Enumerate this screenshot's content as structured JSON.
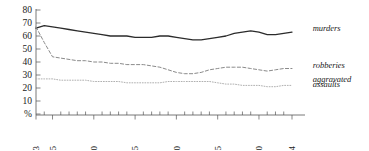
{
  "chart_data": {
    "type": "line",
    "title": "",
    "subtitle": "",
    "xlabel": "",
    "ylabel": "%",
    "xlim": [
      1973,
      2004
    ],
    "ylim": [
      0,
      80
    ],
    "grid": false,
    "legend_position": "right-inline",
    "y_ticks": [
      "80",
      "70",
      "60",
      "50",
      "40",
      "30",
      "20",
      "10",
      "%"
    ],
    "y_tick_values": [
      80,
      70,
      60,
      50,
      40,
      30,
      20,
      10,
      0
    ],
    "x_ticks": [
      "1973",
      "1975",
      "1980",
      "1985",
      "1990",
      "1995",
      "2000",
      "2004"
    ],
    "x_tick_values": [
      1973,
      1975,
      1980,
      1985,
      1990,
      1995,
      2000,
      2004
    ],
    "x": [
      1973,
      1974,
      1975,
      1976,
      1977,
      1978,
      1979,
      1980,
      1981,
      1982,
      1983,
      1984,
      1985,
      1986,
      1987,
      1988,
      1989,
      1990,
      1991,
      1992,
      1993,
      1994,
      1995,
      1996,
      1997,
      1998,
      1999,
      2000,
      2001,
      2002,
      2003,
      2004
    ],
    "series": [
      {
        "name": "murders",
        "label": "murders",
        "color": "#2b2b2b",
        "style": "solid",
        "width": 1.3,
        "values": [
          66,
          68,
          67,
          66,
          65,
          64,
          63,
          62,
          61,
          60,
          60,
          60,
          59,
          59,
          59,
          60,
          60,
          59,
          58,
          57,
          57,
          58,
          59,
          60,
          62,
          63,
          64,
          63,
          61,
          61,
          62,
          63
        ]
      },
      {
        "name": "robberies",
        "label": "robberies",
        "color": "#8a8a8a",
        "style": "dashed",
        "width": 1.0,
        "values": [
          67,
          55,
          44,
          43,
          42,
          41,
          41,
          40,
          40,
          39,
          39,
          38,
          38,
          38,
          37,
          36,
          34,
          32,
          31,
          31,
          32,
          34,
          35,
          36,
          36,
          36,
          35,
          34,
          33,
          34,
          35,
          35
        ]
      },
      {
        "name": "aggravated assaults",
        "label": "aggravated\nassaults",
        "color": "#b0b0b0",
        "style": "dotted",
        "width": 1.0,
        "values": [
          27,
          27,
          27,
          26,
          26,
          26,
          26,
          25,
          25,
          25,
          25,
          24,
          24,
          24,
          24,
          24,
          25,
          25,
          25,
          25,
          25,
          25,
          24,
          23,
          23,
          22,
          22,
          22,
          21,
          21,
          22,
          22
        ]
      }
    ],
    "annotations": [
      {
        "name": "murders-label",
        "text": "murders",
        "x": 2006.5,
        "y": 66
      },
      {
        "name": "robberies-label",
        "text": "robberies",
        "x": 2006.5,
        "y": 38
      },
      {
        "name": "aggravated-assaults-label-line1",
        "text": "aggravated",
        "x": 2006.5,
        "y": 27
      },
      {
        "name": "aggravated-assaults-label-line2",
        "text": "assaults",
        "x": 2006.5,
        "y": 23
      }
    ]
  },
  "axes": {
    "y_axis_name": "percent-axis",
    "x_axis_name": "year-axis"
  }
}
